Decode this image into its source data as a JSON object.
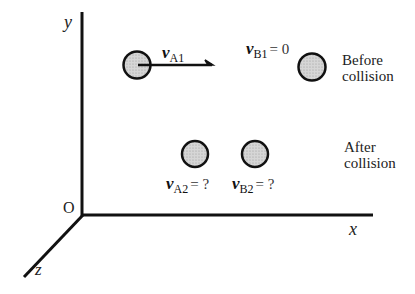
{
  "diagram": {
    "axes": {
      "x_label": "x",
      "y_label": "y",
      "z_label": "z",
      "origin_label": "O"
    },
    "before": {
      "caption_line1": "Before",
      "caption_line2": "collision",
      "ball_a": {
        "velocity_symbol": "v",
        "velocity_subscript": "A1",
        "has_arrow": true
      },
      "ball_b": {
        "velocity_symbol": "v",
        "velocity_subscript": "B1",
        "velocity_value": "= 0"
      }
    },
    "after": {
      "caption_line1": "After",
      "caption_line2": "collision",
      "ball_a": {
        "velocity_symbol": "v",
        "velocity_subscript": "A2",
        "velocity_value": "= ?"
      },
      "ball_b": {
        "velocity_symbol": "v",
        "velocity_subscript": "B2",
        "velocity_value": "= ?"
      }
    },
    "colors": {
      "ball_fill": "#cfcfcf",
      "stroke": "#111111"
    }
  }
}
